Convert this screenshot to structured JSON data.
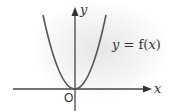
{
  "diagram": {
    "type": "function-graph",
    "curve_label": "y = f(x)",
    "curve_label_parts": {
      "lhs": "y",
      "eq": " = f(",
      "var": "x",
      "close": ")"
    },
    "x_axis_label": "x",
    "y_axis_label": "y",
    "origin_label": "O",
    "curve_shape": "parabola opening upward, vertex at origin",
    "colors": {
      "axis": "#444444",
      "curve": "#555555",
      "text": "#333333"
    }
  }
}
